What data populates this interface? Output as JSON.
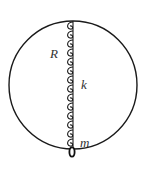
{
  "figure": {
    "labels": {
      "radius": "R",
      "spring_constant": "k",
      "mass": "m"
    },
    "colors": {
      "stroke": "#1a1a1a",
      "text": "#333333",
      "background": "#ffffff"
    },
    "geometry": {
      "circle_center": [
        73,
        85
      ],
      "circle_radius": 64,
      "spring_top_y": 21,
      "spring_bottom_y": 147,
      "spring_coils": 12,
      "mass_position": [
        72,
        152
      ]
    }
  }
}
